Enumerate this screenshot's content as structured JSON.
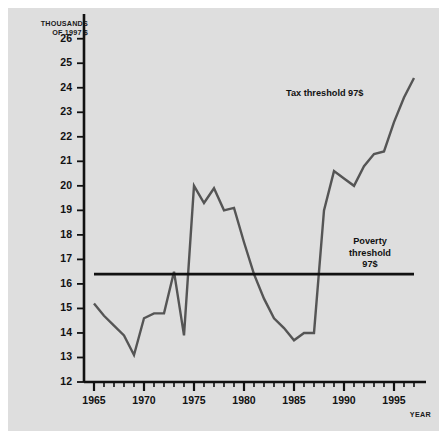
{
  "figure": {
    "background": "#dedede",
    "page_background": "#ffffff",
    "series_color": "#555555",
    "threshold_color": "#111111",
    "axis_color": "#111111"
  },
  "axes": {
    "y_axis_title_line1": "THOUSANDS",
    "y_axis_title_line2": "OF 1997 $",
    "x_axis_title": "YEAR",
    "y_ticks": [
      12,
      13,
      14,
      15,
      16,
      17,
      18,
      19,
      20,
      21,
      22,
      23,
      24,
      25,
      26
    ],
    "x_ticks": [
      1965,
      1970,
      1975,
      1980,
      1985,
      1990,
      1995
    ]
  },
  "annotations": {
    "tax_threshold": "Tax threshold 97$",
    "poverty_threshold_line1": "Poverty",
    "poverty_threshold_line2": "threshold",
    "poverty_threshold_line3": "97$"
  },
  "chart_data": {
    "type": "line",
    "title": "",
    "subtitle": "",
    "xlabel": "YEAR",
    "ylabel": "THOUSANDS OF 1997 $",
    "xlim": [
      1964,
      1998
    ],
    "ylim": [
      12,
      26.6
    ],
    "grid": false,
    "legend": "none",
    "y_tick_labels": [
      "12",
      "13",
      "14",
      "15",
      "16",
      "17",
      "18",
      "19",
      "20",
      "21",
      "22",
      "23",
      "24",
      "25",
      "26"
    ],
    "x_tick_labels": [
      "1965",
      "1970",
      "1975",
      "1980",
      "1985",
      "1990",
      "1995"
    ],
    "x_minor_tick_interval": 1,
    "series": [
      {
        "name": "Tax threshold 97$",
        "color": "#555555",
        "x": [
          1965,
          1966,
          1967,
          1968,
          1969,
          1970,
          1971,
          1972,
          1973,
          1974,
          1975,
          1976,
          1977,
          1978,
          1979,
          1980,
          1981,
          1982,
          1983,
          1984,
          1985,
          1986,
          1987,
          1988,
          1989,
          1990,
          1991,
          1992,
          1993,
          1994,
          1995,
          1996,
          1997
        ],
        "values": [
          15.2,
          14.7,
          14.3,
          13.9,
          13.1,
          14.6,
          14.8,
          14.8,
          16.5,
          13.9,
          20.0,
          19.3,
          19.9,
          19.0,
          19.1,
          17.7,
          16.4,
          15.4,
          14.6,
          14.2,
          13.7,
          14.0,
          14.0,
          19.0,
          20.6,
          20.3,
          20.0,
          20.8,
          21.3,
          21.4,
          22.6,
          23.6,
          24.4
        ]
      },
      {
        "name": "Poverty threshold 97$",
        "color": "#111111",
        "x": [
          1965,
          1997
        ],
        "values": [
          16.4,
          16.4
        ]
      }
    ]
  }
}
